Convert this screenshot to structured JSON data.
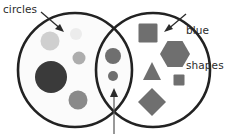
{
  "figure": {
    "name": "venn-diagram",
    "background_color": "#ffffff",
    "width": 227,
    "height": 134
  },
  "labels": {
    "left": {
      "text": "circles",
      "name": "circles-label",
      "color": "#2b2b2b"
    },
    "right": {
      "line1": "blue",
      "line2": "shapes",
      "name": "blue-shapes-label",
      "color": "#2b2b2b"
    }
  },
  "sets": {
    "left_circle": {
      "name": "circles-set-outline",
      "cx": 75,
      "cy": 70,
      "r": 57,
      "stroke": "#222222",
      "stroke_width": 2.6,
      "fill": "#fbfbfb"
    },
    "right_circle": {
      "name": "blue-shapes-set-outline",
      "cx": 153,
      "cy": 70,
      "r": 57,
      "stroke": "#222222",
      "stroke_width": 2.6,
      "fill": "#fbfbfb"
    }
  },
  "annotations": {
    "arrow_left": {
      "name": "circles-label-arrow",
      "x1": 41,
      "y1": 12,
      "x2": 63,
      "y2": 31,
      "color": "#2b2b2b"
    },
    "arrow_right": {
      "name": "blue-shapes-label-arrow",
      "x1": 186,
      "y1": 14,
      "x2": 165,
      "y2": 31,
      "color": "#2b2b2b"
    },
    "arrow_intersection": {
      "name": "intersection-arrow",
      "x1": 114,
      "y1": 133,
      "x2": 114,
      "y2": 90,
      "color": "#555555"
    }
  },
  "shapes_left_only": [
    {
      "name": "circle-light-gray-medium",
      "type": "circle",
      "cx": 50,
      "cy": 41,
      "r": 9.5,
      "fill": "#cfcfcf"
    },
    {
      "name": "circle-very-light-small",
      "type": "circle",
      "cx": 76,
      "cy": 34,
      "r": 6.0,
      "fill": "#ececec"
    },
    {
      "name": "circle-mid-gray-small",
      "type": "circle",
      "cx": 79,
      "cy": 58,
      "r": 6.5,
      "fill": "#adadad"
    },
    {
      "name": "circle-dark-large",
      "type": "circle",
      "cx": 51,
      "cy": 77,
      "r": 16.0,
      "fill": "#3a3a3a"
    },
    {
      "name": "circle-gray-bottom",
      "type": "circle",
      "cx": 78,
      "cy": 100,
      "r": 9.5,
      "fill": "#8a8a8a"
    }
  ],
  "shapes_intersection": [
    {
      "name": "circle-intersection-upper",
      "type": "circle",
      "cx": 113,
      "cy": 56,
      "r": 8.0,
      "fill": "#6f6f6f"
    },
    {
      "name": "circle-intersection-lower",
      "type": "circle",
      "cx": 113,
      "cy": 76,
      "r": 5.0,
      "fill": "#6f6f6f"
    }
  ],
  "shapes_right_only": [
    {
      "name": "square-large",
      "type": "square",
      "cx": 148,
      "cy": 33,
      "size": 19,
      "fill": "#6f6f6f"
    },
    {
      "name": "hexagon",
      "type": "hexagon",
      "cx": 175,
      "cy": 54,
      "r": 15,
      "fill": "#6f6f6f"
    },
    {
      "name": "triangle",
      "type": "triangle",
      "cx": 152,
      "cy": 72,
      "size": 18,
      "fill": "#6f6f6f"
    },
    {
      "name": "square-small",
      "type": "square",
      "cx": 179,
      "cy": 80,
      "size": 11,
      "fill": "#6f6f6f"
    },
    {
      "name": "diamond",
      "type": "diamond",
      "cx": 152,
      "cy": 102,
      "r": 14,
      "fill": "#6f6f6f"
    }
  ]
}
